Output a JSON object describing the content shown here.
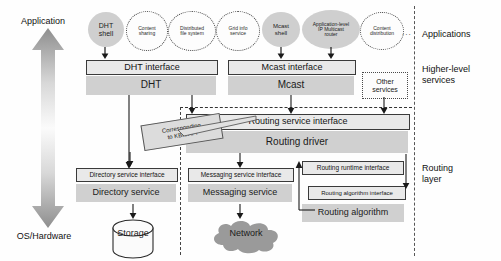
{
  "axis": {
    "top_label": "Application",
    "bottom_label": "OS/Hardware"
  },
  "layer_labels": {
    "applications": "Applications",
    "higher_level_services": "Higher-level\nservices",
    "routing_layer": "Routing\nlayer"
  },
  "applications": {
    "dht_shell": "DHT\nshell",
    "content_sharing": "Content\nsharing",
    "distributed_file_system": "Distributed\nfile system",
    "grid_info_service": "Grid info\nservice",
    "mcast_shell": "Mcast\nshell",
    "ip_multicast_router": "Application-level\nIP Multicast\nrouter",
    "content_distribution": "Content\ndistribution",
    "ellipsis": "..."
  },
  "higher_level": {
    "dht_interface": "DHT interface",
    "dht": "DHT",
    "mcast_interface": "Mcast interface",
    "mcast": "Mcast",
    "other_services": "Other\nservices"
  },
  "routing": {
    "routing_service_interface": "Routing service interface",
    "routing_driver": "Routing driver",
    "callout": "Corresponding\nto KBR API",
    "directory_service_interface": "Directory service interface",
    "directory_service": "Directory service",
    "messaging_service_interface": "Messaging service interface",
    "messaging_service": "Messaging service",
    "routing_runtime_interface": "Routing runtime interface",
    "routing_algorithm_interface": "Routing algorithm interface",
    "routing_algorithm": "Routing algorithm"
  },
  "infrastructure": {
    "storage": "Storage",
    "network": "Network"
  },
  "colors": {
    "block_gray": "#d0d0d0",
    "interface_fill": "#e9e9e9",
    "outline": "#3a3a3a",
    "dashed": "#333333",
    "network_cloud": "#9a9a9a",
    "arrow": "#1a1a1a"
  }
}
